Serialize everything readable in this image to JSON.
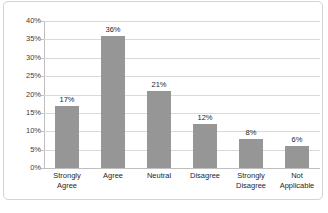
{
  "chart_data": {
    "type": "bar",
    "title": "",
    "subtitle": "",
    "xlabel": "",
    "ylabel": "",
    "categories": [
      "Strongly Agree",
      "Agree",
      "Neutral",
      "Disagree",
      "Strongly Disagree",
      "Not Applicable"
    ],
    "category_lines": [
      [
        "Strongly",
        "Agree"
      ],
      [
        "Agree"
      ],
      [
        "Neutral"
      ],
      [
        "Disagree"
      ],
      [
        "Strongly",
        "Disagree"
      ],
      [
        "Not",
        "Applicable"
      ]
    ],
    "values": [
      17,
      36,
      21,
      12,
      8,
      6
    ],
    "data_labels": [
      "17%",
      "36%",
      "21%",
      "12%",
      "8%",
      "6%"
    ],
    "ylim": [
      0,
      40
    ],
    "ytick_step": 5,
    "ytick_labels": [
      "40%",
      "35%",
      "30%",
      "25%",
      "20%",
      "15%",
      "10%",
      "5%",
      "0%"
    ],
    "ytick_values": [
      40,
      35,
      30,
      25,
      20,
      15,
      10,
      5,
      0
    ],
    "grid": "horizontal",
    "legend": "none",
    "series": [
      {
        "name": "Response share",
        "values": [
          17,
          36,
          21,
          12,
          8,
          6
        ]
      }
    ],
    "colors": {
      "bar": "#969696",
      "gridline": "#d9d9d9",
      "axis": "#bfbfbf",
      "text": "#262626",
      "frame": "#d3d3d3",
      "background": "#ffffff"
    }
  },
  "caption": {
    "text": ""
  }
}
